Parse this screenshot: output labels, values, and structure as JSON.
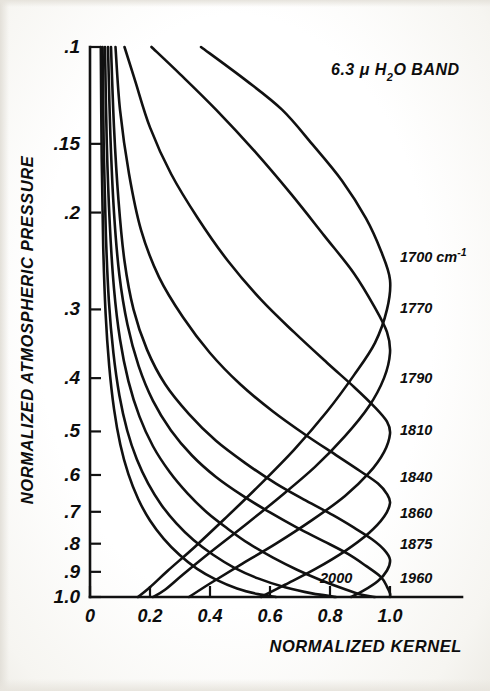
{
  "figure": {
    "title_parts": {
      "value": "6.3",
      "mu": "μ",
      "species_pre": "H",
      "species_sub": "2",
      "species_post": "O",
      "band_word": "BAND"
    }
  },
  "axes": {
    "y_title": "NORMALIZED  ATMOSPHERIC  PRESSURE",
    "x_title": "NORMALIZED   KERNEL",
    "y_ticks": [
      {
        "label": ".1",
        "value": 0.1
      },
      {
        "label": ".15",
        "value": 0.15
      },
      {
        "label": ".2",
        "value": 0.2
      },
      {
        "label": ".3",
        "value": 0.3
      },
      {
        "label": ".4",
        "value": 0.4
      },
      {
        "label": ".5",
        "value": 0.5
      },
      {
        "label": ".6",
        "value": 0.6
      },
      {
        "label": ".7",
        "value": 0.7
      },
      {
        "label": ".8",
        "value": 0.8
      },
      {
        "label": ".9",
        "value": 0.9
      },
      {
        "label": "1.0",
        "value": 1.0
      }
    ],
    "x_ticks": [
      {
        "label": "0",
        "value": 0.0
      },
      {
        "label": "0.2",
        "value": 0.2
      },
      {
        "label": "0.4",
        "value": 0.4
      },
      {
        "label": "0.6",
        "value": 0.6
      },
      {
        "label": "0.8",
        "value": 0.8
      },
      {
        "label": "1.0",
        "value": 1.0
      }
    ]
  },
  "curve_labels": [
    {
      "text": "1700 cm",
      "sup": "-1",
      "y_px": 262
    },
    {
      "text": "1770",
      "sup": "",
      "y_px": 313
    },
    {
      "text": "1790",
      "sup": "",
      "y_px": 383
    },
    {
      "text": "1810",
      "sup": "",
      "y_px": 435
    },
    {
      "text": "1840",
      "sup": "",
      "y_px": 482
    },
    {
      "text": "1860",
      "sup": "",
      "y_px": 518
    },
    {
      "text": "1875",
      "sup": "",
      "y_px": 549
    },
    {
      "text": "1960",
      "sup": "",
      "y_px": 583
    },
    {
      "text": "2000",
      "sup": "",
      "y_px": 583,
      "x_px": 320,
      "inside": true
    }
  ],
  "colors": {
    "ink": "#111111",
    "paper": "#fdfdfb",
    "scan_edge": "#e5e2db"
  },
  "chart_data": {
    "type": "line",
    "xlabel": "NORMALIZED   KERNEL",
    "ylabel": "NORMALIZED  ATMOSPHERIC  PRESSURE",
    "xlim": [
      0.0,
      1.18
    ],
    "ylim_log_pressure": [
      0.1,
      1.0
    ],
    "y_axis_scale": "log",
    "y_axis_inverted": true,
    "grid": false,
    "legend": "inline-right-of-curve-peaks",
    "x_tick_values": [
      0.0,
      0.2,
      0.4,
      0.6,
      0.8,
      1.0
    ],
    "y_tick_values": [
      0.1,
      0.15,
      0.2,
      0.3,
      0.4,
      0.5,
      0.6,
      0.7,
      0.8,
      0.9,
      1.0
    ],
    "series": [
      {
        "name": "1700 cm-1",
        "points": [
          [
            0.37,
            0.1
          ],
          [
            0.52,
            0.115
          ],
          [
            0.64,
            0.13
          ],
          [
            0.74,
            0.15
          ],
          [
            0.84,
            0.175
          ],
          [
            0.92,
            0.205
          ],
          [
            0.97,
            0.235
          ],
          [
            1.0,
            0.265
          ],
          [
            0.99,
            0.3
          ],
          [
            0.95,
            0.345
          ],
          [
            0.88,
            0.395
          ],
          [
            0.79,
            0.46
          ],
          [
            0.68,
            0.54
          ],
          [
            0.56,
            0.63
          ],
          [
            0.45,
            0.72
          ],
          [
            0.35,
            0.81
          ],
          [
            0.26,
            0.895
          ],
          [
            0.2,
            0.96
          ],
          [
            0.16,
            1.0
          ]
        ]
      },
      {
        "name": "1770",
        "points": [
          [
            0.205,
            0.1
          ],
          [
            0.3,
            0.112
          ],
          [
            0.42,
            0.13
          ],
          [
            0.55,
            0.155
          ],
          [
            0.67,
            0.185
          ],
          [
            0.78,
            0.22
          ],
          [
            0.88,
            0.258
          ],
          [
            0.95,
            0.298
          ],
          [
            0.99,
            0.33
          ],
          [
            1.0,
            0.36
          ],
          [
            0.98,
            0.4
          ],
          [
            0.93,
            0.45
          ],
          [
            0.85,
            0.51
          ],
          [
            0.75,
            0.58
          ],
          [
            0.63,
            0.66
          ],
          [
            0.51,
            0.745
          ],
          [
            0.4,
            0.83
          ],
          [
            0.31,
            0.91
          ],
          [
            0.25,
            0.97
          ],
          [
            0.21,
            1.0
          ]
        ]
      },
      {
        "name": "1790",
        "points": [
          [
            0.115,
            0.1
          ],
          [
            0.15,
            0.115
          ],
          [
            0.2,
            0.14
          ],
          [
            0.27,
            0.17
          ],
          [
            0.36,
            0.205
          ],
          [
            0.46,
            0.245
          ],
          [
            0.57,
            0.288
          ],
          [
            0.68,
            0.33
          ],
          [
            0.79,
            0.375
          ],
          [
            0.88,
            0.415
          ],
          [
            0.95,
            0.452
          ],
          [
            0.99,
            0.48
          ],
          [
            1.0,
            0.505
          ],
          [
            0.98,
            0.545
          ],
          [
            0.93,
            0.595
          ],
          [
            0.85,
            0.655
          ],
          [
            0.74,
            0.725
          ],
          [
            0.62,
            0.8
          ],
          [
            0.5,
            0.875
          ],
          [
            0.4,
            0.945
          ],
          [
            0.33,
            1.0
          ]
        ]
      },
      {
        "name": "1810",
        "points": [
          [
            0.085,
            0.1
          ],
          [
            0.1,
            0.13
          ],
          [
            0.13,
            0.17
          ],
          [
            0.17,
            0.215
          ],
          [
            0.23,
            0.262
          ],
          [
            0.31,
            0.31
          ],
          [
            0.4,
            0.36
          ],
          [
            0.5,
            0.41
          ],
          [
            0.61,
            0.46
          ],
          [
            0.72,
            0.508
          ],
          [
            0.82,
            0.552
          ],
          [
            0.9,
            0.59
          ],
          [
            0.96,
            0.622
          ],
          [
            0.99,
            0.65
          ],
          [
            1.0,
            0.675
          ],
          [
            0.98,
            0.715
          ],
          [
            0.93,
            0.765
          ],
          [
            0.85,
            0.825
          ],
          [
            0.75,
            0.89
          ],
          [
            0.65,
            0.95
          ],
          [
            0.57,
            1.0
          ]
        ]
      },
      {
        "name": "1840",
        "points": [
          [
            0.07,
            0.1
          ],
          [
            0.08,
            0.14
          ],
          [
            0.095,
            0.19
          ],
          [
            0.115,
            0.245
          ],
          [
            0.145,
            0.3
          ],
          [
            0.19,
            0.355
          ],
          [
            0.25,
            0.41
          ],
          [
            0.33,
            0.465
          ],
          [
            0.42,
            0.52
          ],
          [
            0.52,
            0.572
          ],
          [
            0.62,
            0.622
          ],
          [
            0.72,
            0.668
          ],
          [
            0.81,
            0.71
          ],
          [
            0.88,
            0.748
          ],
          [
            0.94,
            0.785
          ],
          [
            0.98,
            0.82
          ],
          [
            1.0,
            0.855
          ],
          [
            0.99,
            0.895
          ],
          [
            0.96,
            0.935
          ],
          [
            0.91,
            0.975
          ],
          [
            0.87,
            1.0
          ]
        ]
      },
      {
        "name": "1860",
        "points": [
          [
            0.06,
            0.1
          ],
          [
            0.068,
            0.145
          ],
          [
            0.08,
            0.2
          ],
          [
            0.098,
            0.26
          ],
          [
            0.125,
            0.32
          ],
          [
            0.162,
            0.38
          ],
          [
            0.21,
            0.44
          ],
          [
            0.27,
            0.498
          ],
          [
            0.34,
            0.553
          ],
          [
            0.42,
            0.605
          ],
          [
            0.51,
            0.655
          ],
          [
            0.6,
            0.702
          ],
          [
            0.69,
            0.748
          ],
          [
            0.78,
            0.792
          ],
          [
            0.86,
            0.835
          ],
          [
            0.92,
            0.878
          ],
          [
            0.97,
            0.92
          ],
          [
            0.99,
            0.958
          ],
          [
            1.0,
            0.985
          ],
          [
            1.0,
            1.0
          ]
        ]
      },
      {
        "name": "1875",
        "points": [
          [
            0.05,
            0.1
          ],
          [
            0.056,
            0.15
          ],
          [
            0.066,
            0.21
          ],
          [
            0.08,
            0.275
          ],
          [
            0.1,
            0.34
          ],
          [
            0.128,
            0.405
          ],
          [
            0.165,
            0.47
          ],
          [
            0.21,
            0.532
          ],
          [
            0.265,
            0.592
          ],
          [
            0.325,
            0.648
          ],
          [
            0.39,
            0.702
          ],
          [
            0.46,
            0.752
          ],
          [
            0.53,
            0.8
          ],
          [
            0.61,
            0.848
          ],
          [
            0.69,
            0.892
          ],
          [
            0.77,
            0.932
          ],
          [
            0.85,
            0.968
          ],
          [
            0.91,
            0.992
          ],
          [
            0.95,
            1.0
          ]
        ]
      },
      {
        "name": "1960",
        "points": [
          [
            0.042,
            0.1
          ],
          [
            0.046,
            0.155
          ],
          [
            0.053,
            0.22
          ],
          [
            0.063,
            0.29
          ],
          [
            0.078,
            0.36
          ],
          [
            0.098,
            0.43
          ],
          [
            0.124,
            0.498
          ],
          [
            0.156,
            0.562
          ],
          [
            0.194,
            0.622
          ],
          [
            0.238,
            0.68
          ],
          [
            0.288,
            0.735
          ],
          [
            0.345,
            0.788
          ],
          [
            0.41,
            0.838
          ],
          [
            0.48,
            0.884
          ],
          [
            0.56,
            0.925
          ],
          [
            0.65,
            0.96
          ],
          [
            0.74,
            0.985
          ],
          [
            0.82,
            1.0
          ]
        ]
      },
      {
        "name": "2000",
        "points": [
          [
            0.036,
            0.1
          ],
          [
            0.039,
            0.16
          ],
          [
            0.044,
            0.23
          ],
          [
            0.052,
            0.305
          ],
          [
            0.064,
            0.38
          ],
          [
            0.08,
            0.455
          ],
          [
            0.101,
            0.528
          ],
          [
            0.128,
            0.598
          ],
          [
            0.161,
            0.664
          ],
          [
            0.2,
            0.726
          ],
          [
            0.246,
            0.784
          ],
          [
            0.298,
            0.838
          ],
          [
            0.356,
            0.888
          ],
          [
            0.42,
            0.93
          ],
          [
            0.49,
            0.965
          ],
          [
            0.56,
            0.988
          ],
          [
            0.62,
            1.0
          ]
        ]
      }
    ]
  }
}
